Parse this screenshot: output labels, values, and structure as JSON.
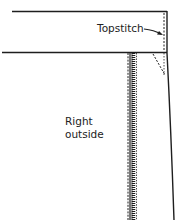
{
  "diagram": {
    "labels": {
      "topstitch": "Topstitch",
      "right_outside_line1": "Right",
      "right_outside_line2": "outside"
    },
    "colors": {
      "ink": "#1e1e1e",
      "background": "#ffffff"
    }
  }
}
